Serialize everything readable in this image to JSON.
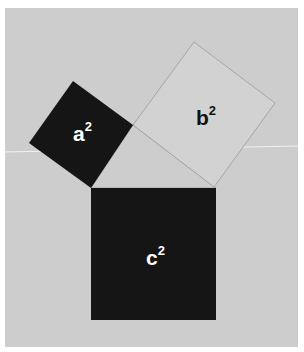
{
  "diagram": {
    "colors": {
      "page_background": "#ffffff",
      "panel_background": "#cdcdcd",
      "dark_square": "#151515",
      "light_square": "#d2d2d2",
      "outline": "#9a9a9a",
      "light_text": "#ffffff",
      "dark_text": "#111111"
    },
    "squares": [
      {
        "id": "a",
        "label": "a",
        "exponent": "2",
        "fill": "dark"
      },
      {
        "id": "b",
        "label": "b",
        "exponent": "2",
        "fill": "light"
      },
      {
        "id": "c",
        "label": "c",
        "exponent": "2",
        "fill": "dark"
      }
    ]
  }
}
